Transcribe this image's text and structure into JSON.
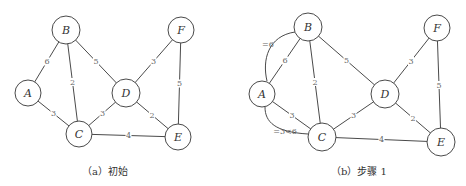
{
  "panels": [
    {
      "caption": "（a）初始",
      "nodes": [
        {
          "id": "A",
          "x": 28,
          "y": 93,
          "r": 13
        },
        {
          "id": "B",
          "x": 66,
          "y": 30,
          "r": 14
        },
        {
          "id": "C",
          "x": 79,
          "y": 134,
          "r": 13
        },
        {
          "id": "D",
          "x": 126,
          "y": 93,
          "r": 14
        },
        {
          "id": "E",
          "x": 178,
          "y": 137,
          "r": 13
        },
        {
          "id": "F",
          "x": 181,
          "y": 30,
          "r": 13
        }
      ],
      "edges": [
        {
          "from": "A",
          "to": "B",
          "weight": "6"
        },
        {
          "from": "A",
          "to": "C",
          "weight": "3"
        },
        {
          "from": "B",
          "to": "C",
          "weight": "2"
        },
        {
          "from": "B",
          "to": "D",
          "weight": "5"
        },
        {
          "from": "C",
          "to": "D",
          "weight": "3"
        },
        {
          "from": "C",
          "to": "E",
          "weight": "4"
        },
        {
          "from": "D",
          "to": "E",
          "weight": "2"
        },
        {
          "from": "D",
          "to": "F",
          "weight": "3"
        },
        {
          "from": "F",
          "to": "E",
          "weight": "5"
        }
      ],
      "annotations": []
    },
    {
      "caption": "（b）步骤 1",
      "nodes": [
        {
          "id": "A",
          "x": 262,
          "y": 94,
          "r": 13
        },
        {
          "id": "B",
          "x": 308,
          "y": 27,
          "r": 14
        },
        {
          "id": "C",
          "x": 322,
          "y": 137,
          "r": 14
        },
        {
          "id": "D",
          "x": 385,
          "y": 94,
          "r": 14
        },
        {
          "id": "E",
          "x": 441,
          "y": 142,
          "r": 14
        },
        {
          "id": "F",
          "x": 437,
          "y": 28,
          "r": 13
        }
      ],
      "edges": [
        {
          "from": "A",
          "to": "B",
          "weight": "6"
        },
        {
          "from": "A",
          "to": "C",
          "weight": "3"
        },
        {
          "from": "B",
          "to": "C",
          "weight": "2"
        },
        {
          "from": "B",
          "to": "D",
          "weight": "5"
        },
        {
          "from": "C",
          "to": "D",
          "weight": "3"
        },
        {
          "from": "C",
          "to": "E",
          "weight": "4"
        },
        {
          "from": "D",
          "to": "E",
          "weight": "2"
        },
        {
          "from": "D",
          "to": "F",
          "weight": "3"
        },
        {
          "from": "F",
          "to": "E",
          "weight": "5"
        }
      ],
      "annotations": [
        {
          "label": "=6",
          "path": "M 267 81 C 262 60, 268 36, 295 32",
          "lx": 268,
          "ly": 44
        },
        {
          "label": "=3<6",
          "path": "M 265 107 C 265 122, 275 132, 308 134",
          "lx": 285,
          "ly": 131
        }
      ]
    }
  ]
}
